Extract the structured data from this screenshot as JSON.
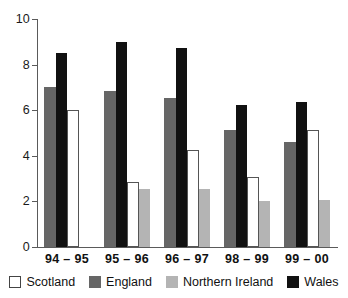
{
  "chart_data": {
    "type": "bar",
    "title": "",
    "subtitle": "",
    "xlabel": "",
    "ylabel": "",
    "ylim": [
      0,
      10
    ],
    "yticks": [
      0,
      2,
      4,
      6,
      8,
      10
    ],
    "grid": false,
    "legend_position": "bottom",
    "categories": [
      "94 – 95",
      "95 – 96",
      "96 – 97",
      "98 – 99",
      "99 – 00"
    ],
    "bar_order": [
      "England",
      "Wales",
      "Scotland",
      "Northern Ireland"
    ],
    "series": [
      {
        "name": "Scotland",
        "color": "#ffffff",
        "values": [
          6.0,
          2.85,
          4.25,
          3.05,
          5.15
        ]
      },
      {
        "name": "England",
        "color": "#666666",
        "values": [
          7.0,
          6.85,
          6.55,
          5.15,
          4.6
        ]
      },
      {
        "name": "Northern Ireland",
        "color": "#b4b4b4",
        "values": [
          null,
          2.55,
          2.55,
          2.0,
          2.05
        ]
      },
      {
        "name": "Wales",
        "color": "#111111",
        "values": [
          8.5,
          9.0,
          8.75,
          6.25,
          6.35
        ]
      }
    ]
  },
  "axis": {
    "ytick_labels": [
      "0",
      "2",
      "4",
      "6",
      "8",
      "10"
    ]
  },
  "xaxis": {
    "labels": [
      "94 – 95",
      "95 – 96",
      "96 – 97",
      "98 – 99",
      "99 – 00"
    ]
  },
  "legend": {
    "items": [
      {
        "label": "Scotland",
        "swatch": "scotland-swatch"
      },
      {
        "label": "England",
        "swatch": "england-swatch"
      },
      {
        "label": "Northern Ireland",
        "swatch": "northern-ireland-swatch"
      },
      {
        "label": "Wales",
        "swatch": "wales-swatch"
      }
    ]
  }
}
